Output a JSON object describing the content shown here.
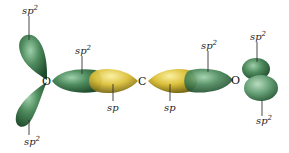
{
  "diagram": {
    "atoms": [
      {
        "id": "O_left",
        "symbol": "O"
      },
      {
        "id": "C_center",
        "symbol": "C"
      },
      {
        "id": "O_right",
        "symbol": "O"
      }
    ],
    "labels": {
      "left_top": {
        "base": "sp",
        "sup": "2"
      },
      "left_bottom": {
        "base": "sp",
        "sup": "2"
      },
      "left_bond": {
        "base": "sp",
        "sup": "2"
      },
      "carbon_left": {
        "base": "sp",
        "sup": ""
      },
      "carbon_right": {
        "base": "sp",
        "sup": ""
      },
      "right_bond": {
        "base": "sp",
        "sup": "2"
      },
      "right_top": {
        "base": "sp",
        "sup": "2"
      },
      "right_bottom": {
        "base": "sp",
        "sup": "2"
      }
    },
    "colors": {
      "sp2_orbital": "#3f7a4f",
      "sp2_highlight": "#8cc29a",
      "sp_orbital": "#d8b830",
      "sp_highlight": "#f3e27a",
      "background": "#ffffff"
    }
  }
}
